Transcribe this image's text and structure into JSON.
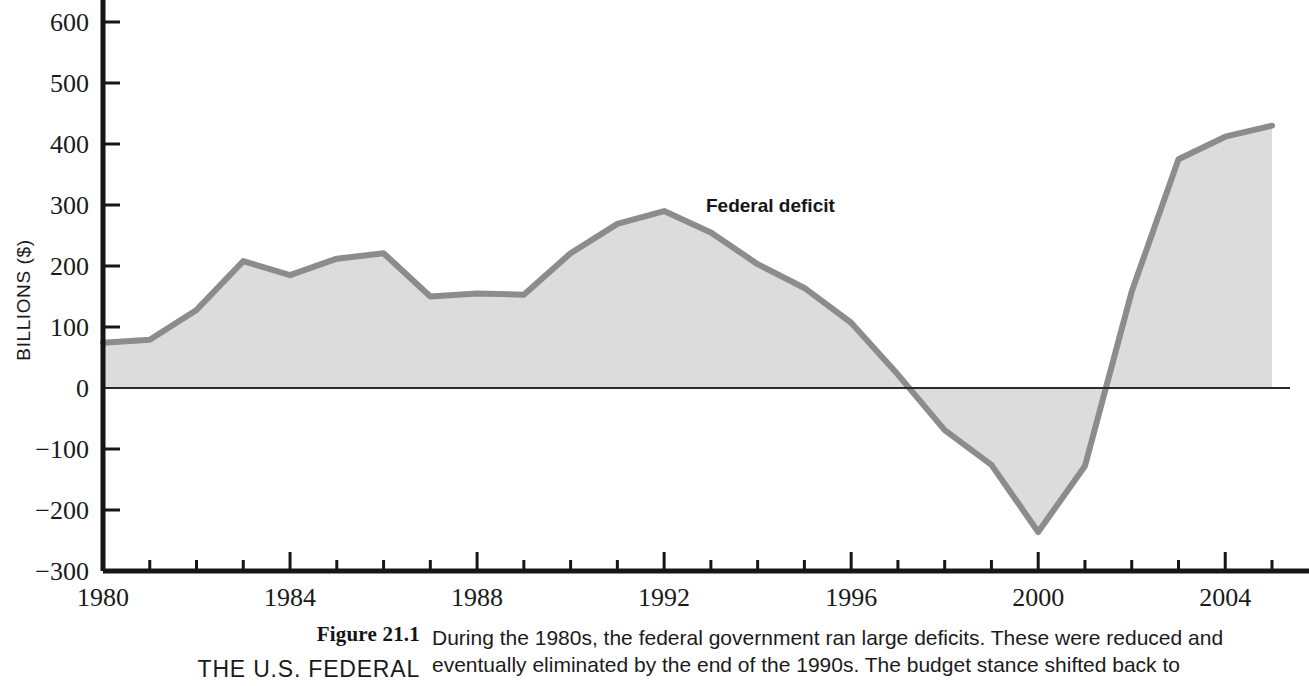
{
  "chart_data": {
    "type": "area",
    "title": "",
    "series_label": "Federal deficit",
    "xlabel": "",
    "ylabel": "BILLIONS ($)",
    "xlim": [
      1980,
      2005
    ],
    "ylim": [
      -300,
      640
    ],
    "ytick_values": [
      600,
      500,
      400,
      300,
      200,
      100,
      0,
      -100,
      -200,
      -300
    ],
    "ytick_labels": [
      "600",
      "500",
      "400",
      "300",
      "200",
      "100",
      "0",
      "−100",
      "−200",
      "−300"
    ],
    "xtick_values": [
      1980,
      1984,
      1988,
      1992,
      1996,
      2000,
      2004
    ],
    "xtick_labels": [
      "1980",
      "1984",
      "1988",
      "1992",
      "1996",
      "2000",
      "2004"
    ],
    "minor_xtick_step": 1,
    "grid": false,
    "legend_position": "inline-annotation",
    "x": [
      1980,
      1981,
      1982,
      1983,
      1984,
      1985,
      1986,
      1987,
      1988,
      1989,
      1990,
      1991,
      1992,
      1993,
      1994,
      1995,
      1996,
      1997,
      1998,
      1999,
      2000,
      2001,
      2002,
      2003,
      2004,
      2005
    ],
    "values": [
      74,
      79,
      128,
      208,
      185,
      212,
      221,
      150,
      155,
      153,
      221,
      269,
      290,
      255,
      203,
      164,
      107,
      22,
      -69,
      -126,
      -236,
      -128,
      158,
      375,
      412,
      430
    ],
    "colors": {
      "area_fill": "#dcdcdc",
      "line": "#8c8c8c",
      "axis": "#161616",
      "zero_line": "#2a2a2a",
      "text": "#1a1a1a"
    }
  },
  "caption": {
    "figure_number": "Figure 21.1",
    "figure_title": "THE U.S. FEDERAL",
    "lines": [
      "During the 1980s, the federal government ran large deficits. These were reduced and",
      "eventually eliminated by the end of the 1990s. The budget stance shifted back to"
    ]
  }
}
